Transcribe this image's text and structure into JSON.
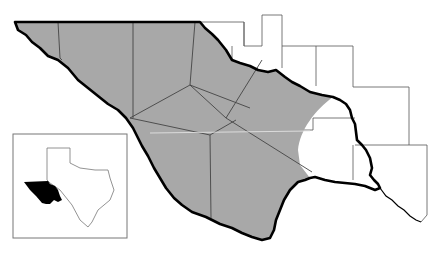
{
  "map": {
    "type": "regional locator map",
    "width": 439,
    "height": 255,
    "colors": {
      "background": "#ffffff",
      "shaded_region": "#a8a8a8",
      "region_border": "#000000",
      "county_lines": "#444444",
      "inset_highlight": "#000000",
      "inset_outline": "#666666"
    },
    "main_region": {
      "label": "",
      "shaded": true
    },
    "inset": {
      "label": "",
      "depicts": "Texas state outline with highlighted western region"
    }
  }
}
